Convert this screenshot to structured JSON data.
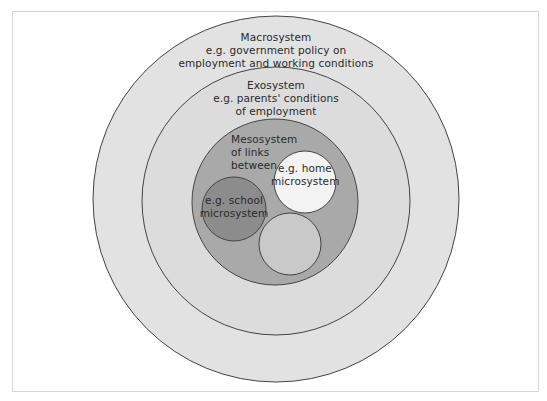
{
  "diagram": {
    "colors": {
      "background": "#ffffff",
      "frame_border": "#d6d6d6",
      "stroke": "#444444",
      "macrosystem_fill": "#e2e2e2",
      "exosystem_fill": "#dcdcdc",
      "mesosystem_fill": "#a9a9a9",
      "school_fill": "#8c8c8c",
      "home_fill": "#f3f3f3",
      "unlabeled_micro_fill": "#c9c9c9",
      "text": "#2a2a2a"
    },
    "macrosystem": {
      "line1": "Macrosystem",
      "line2": "e.g. government policy on",
      "line3": "employment and working conditions"
    },
    "exosystem": {
      "line1": "Exosystem",
      "line2": "e.g. parents' conditions",
      "line3": "of employment"
    },
    "mesosystem": {
      "line1": "Mesosystem",
      "line2": "of links",
      "line3": "between"
    },
    "home_microsystem": {
      "line1": "e.g. home",
      "line2": "microsystem"
    },
    "school_microsystem": {
      "line1": "e.g. school",
      "line2": "microsystem"
    },
    "unlabeled_microsystem": {
      "label": ""
    }
  }
}
